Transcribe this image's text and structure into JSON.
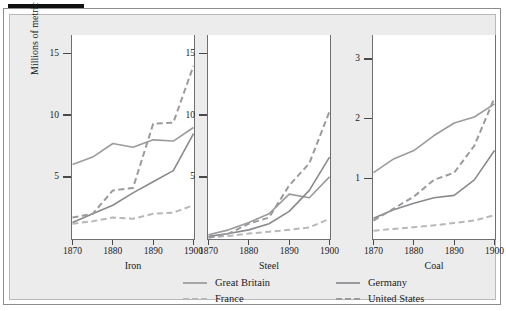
{
  "figure": {
    "ylabel": "Millions of metric tons",
    "caption": ""
  },
  "legend": {
    "entries": [
      {
        "label": "Great Britain",
        "color": "#9b9b9e",
        "dash": "solid"
      },
      {
        "label": "France",
        "color": "#b8b8bb",
        "dash": "dashed"
      },
      {
        "label": "Germany",
        "color": "#8a8a8e",
        "dash": "solid"
      },
      {
        "label": "United States",
        "color": "#9b9b9e",
        "dash": "dashed"
      }
    ]
  },
  "chart_data": [
    {
      "type": "line",
      "title": "Iron",
      "xlabel": "Iron",
      "ylabel": "Millions of metric tons",
      "xlim": [
        1870,
        1900
      ],
      "ylim": [
        0,
        16.5
      ],
      "xticks": [
        1870,
        1880,
        1890,
        1900
      ],
      "yticks": [
        5,
        10,
        15
      ],
      "grid": false,
      "x": [
        1870,
        1875,
        1880,
        1885,
        1890,
        1895,
        1900
      ],
      "series": [
        {
          "name": "Great Britain",
          "dash": "solid",
          "color": "#9b9b9e",
          "values": [
            6.0,
            6.6,
            7.7,
            7.4,
            8.0,
            7.9,
            9.0
          ]
        },
        {
          "name": "France",
          "dash": "dashed",
          "color": "#b8b8bb",
          "values": [
            1.2,
            1.4,
            1.7,
            1.6,
            2.0,
            2.1,
            2.7
          ]
        },
        {
          "name": "Germany",
          "dash": "solid",
          "color": "#8a8a8e",
          "values": [
            1.3,
            2.0,
            2.7,
            3.7,
            4.6,
            5.5,
            8.5
          ]
        },
        {
          "name": "United States",
          "dash": "dashed",
          "color": "#9b9b9e",
          "values": [
            1.7,
            2.0,
            3.9,
            4.1,
            9.3,
            9.4,
            14.0
          ]
        }
      ]
    },
    {
      "type": "line",
      "title": "Steel",
      "xlabel": "Steel",
      "ylabel": "Millions of metric tons",
      "xlim": [
        1870,
        1900
      ],
      "ylim": [
        0,
        16.5
      ],
      "xticks": [
        1870,
        1880,
        1890,
        1900
      ],
      "yticks": [
        5,
        10,
        15
      ],
      "grid": false,
      "x": [
        1870,
        1875,
        1880,
        1885,
        1890,
        1895,
        1900
      ],
      "series": [
        {
          "name": "Great Britain",
          "dash": "solid",
          "color": "#9b9b9e",
          "values": [
            0.3,
            0.7,
            1.3,
            2.0,
            3.6,
            3.3,
            5.0
          ]
        },
        {
          "name": "France",
          "dash": "dashed",
          "color": "#b8b8bb",
          "values": [
            0.08,
            0.2,
            0.4,
            0.55,
            0.7,
            0.9,
            1.6
          ]
        },
        {
          "name": "Germany",
          "dash": "solid",
          "color": "#8a8a8e",
          "values": [
            0.17,
            0.4,
            0.7,
            1.2,
            2.2,
            3.9,
            6.6
          ]
        },
        {
          "name": "United States",
          "dash": "dashed",
          "color": "#9b9b9e",
          "values": [
            0.07,
            0.4,
            1.2,
            1.7,
            4.3,
            6.1,
            10.3
          ]
        }
      ]
    },
    {
      "type": "line",
      "title": "Coal",
      "xlabel": "Coal",
      "ylabel": "Millions of metric tons",
      "xlim": [
        1870,
        1900
      ],
      "ylim": [
        0,
        3.4
      ],
      "xticks": [
        1870,
        1880,
        1890,
        1900
      ],
      "yticks": [
        1,
        2,
        3
      ],
      "grid": false,
      "x": [
        1870,
        1875,
        1880,
        1885,
        1890,
        1895,
        1900
      ],
      "series": [
        {
          "name": "Great Britain",
          "dash": "solid",
          "color": "#9b9b9e",
          "values": [
            1.1,
            1.33,
            1.47,
            1.72,
            1.93,
            2.03,
            2.25
          ]
        },
        {
          "name": "France",
          "dash": "dashed",
          "color": "#b8b8bb",
          "values": [
            0.13,
            0.16,
            0.19,
            0.22,
            0.26,
            0.3,
            0.39
          ]
        },
        {
          "name": "Germany",
          "dash": "solid",
          "color": "#8a8a8e",
          "values": [
            0.34,
            0.48,
            0.59,
            0.68,
            0.72,
            0.98,
            1.47
          ]
        },
        {
          "name": "United States",
          "dash": "dashed",
          "color": "#9b9b9e",
          "values": [
            0.3,
            0.5,
            0.7,
            0.98,
            1.1,
            1.55,
            2.35
          ]
        }
      ]
    }
  ]
}
